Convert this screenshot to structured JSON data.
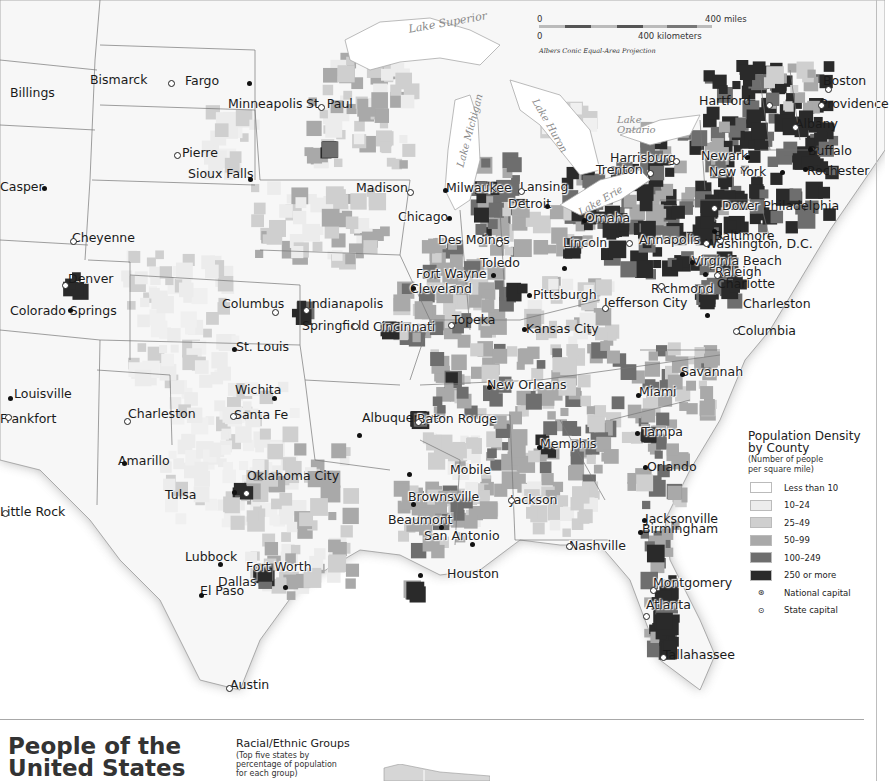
{
  "map": {
    "projection": "Albers Conic Equal-Area Projection",
    "scale": {
      "miles_zero": "0",
      "miles_label": "400 miles",
      "km_zero": "0",
      "km_label": "400 kilometers"
    },
    "lakes": [
      "Lake Superior",
      "Lake Michigan",
      "Lake Huron",
      "Lake Ontario",
      "Lake Erie"
    ],
    "cities": [
      {
        "name": "Billings",
        "type": "city"
      },
      {
        "name": "Bismarck",
        "type": "state-capital"
      },
      {
        "name": "Fargo",
        "type": "city"
      },
      {
        "name": "Pierre",
        "type": "state-capital"
      },
      {
        "name": "Sioux Falls",
        "type": "city"
      },
      {
        "name": "Casper",
        "type": "city"
      },
      {
        "name": "Cheyenne",
        "type": "state-capital"
      },
      {
        "name": "Denver",
        "type": "state-capital"
      },
      {
        "name": "Colorado Springs",
        "type": "city"
      },
      {
        "name": "Minneapolis",
        "type": "city"
      },
      {
        "name": "St. Paul",
        "type": "state-capital"
      },
      {
        "name": "Madison",
        "type": "state-capital"
      },
      {
        "name": "Milwaukee",
        "type": "city"
      },
      {
        "name": "Lansing",
        "type": "state-capital"
      },
      {
        "name": "Detroit",
        "type": "city"
      },
      {
        "name": "Chicago",
        "type": "city"
      },
      {
        "name": "Des Moines",
        "type": "state-capital"
      },
      {
        "name": "Omaha",
        "type": "city"
      },
      {
        "name": "Lincoln",
        "type": "state-capital"
      },
      {
        "name": "Toledo",
        "type": "city"
      },
      {
        "name": "Fort Wayne",
        "type": "city"
      },
      {
        "name": "Cleveland",
        "type": "city"
      },
      {
        "name": "Pittsburgh",
        "type": "city"
      },
      {
        "name": "Columbus",
        "type": "state-capital"
      },
      {
        "name": "Indianapolis",
        "type": "state-capital"
      },
      {
        "name": "Springfield",
        "type": "state-capital"
      },
      {
        "name": "Cincinnati",
        "type": "city"
      },
      {
        "name": "Topeka",
        "type": "state-capital"
      },
      {
        "name": "Kansas City",
        "type": "city"
      },
      {
        "name": "Jefferson City",
        "type": "state-capital"
      },
      {
        "name": "St. Louis",
        "type": "city"
      },
      {
        "name": "Louisville",
        "type": "city"
      },
      {
        "name": "Frankfort",
        "type": "state-capital"
      },
      {
        "name": "Charleston",
        "type": "state-capital"
      },
      {
        "name": "Wichita",
        "type": "city"
      },
      {
        "name": "Santa Fe",
        "type": "state-capital"
      },
      {
        "name": "Albuquerque",
        "type": "city"
      },
      {
        "name": "Amarillo",
        "type": "city"
      },
      {
        "name": "Tulsa",
        "type": "city"
      },
      {
        "name": "Oklahoma City",
        "type": "state-capital"
      },
      {
        "name": "Little Rock",
        "type": "state-capital"
      },
      {
        "name": "Lubbock",
        "type": "city"
      },
      {
        "name": "Fort Worth",
        "type": "city"
      },
      {
        "name": "Dallas",
        "type": "city"
      },
      {
        "name": "El Paso",
        "type": "city"
      },
      {
        "name": "Austin",
        "type": "state-capital"
      },
      {
        "name": "Beaumont",
        "type": "city"
      },
      {
        "name": "Houston",
        "type": "city"
      },
      {
        "name": "San Antonio",
        "type": "city"
      },
      {
        "name": "Brownsville",
        "type": "city"
      },
      {
        "name": "Baton Rouge",
        "type": "state-capital"
      },
      {
        "name": "New Orleans",
        "type": "city"
      },
      {
        "name": "Mobile",
        "type": "city"
      },
      {
        "name": "Jackson",
        "type": "state-capital"
      },
      {
        "name": "Memphis",
        "type": "city"
      },
      {
        "name": "Nashville",
        "type": "state-capital"
      },
      {
        "name": "Birmingham",
        "type": "city"
      },
      {
        "name": "Montgomery",
        "type": "state-capital"
      },
      {
        "name": "Atlanta",
        "type": "state-capital"
      },
      {
        "name": "Tallahassee",
        "type": "state-capital"
      },
      {
        "name": "Jacksonville",
        "type": "city"
      },
      {
        "name": "Orlando",
        "type": "city"
      },
      {
        "name": "Tampa",
        "type": "city"
      },
      {
        "name": "Miami",
        "type": "city"
      },
      {
        "name": "Savannah",
        "type": "city"
      },
      {
        "name": "Charleston",
        "type": "city"
      },
      {
        "name": "Columbia",
        "type": "state-capital"
      },
      {
        "name": "Charlotte",
        "type": "city"
      },
      {
        "name": "Raleigh",
        "type": "state-capital"
      },
      {
        "name": "Richmond",
        "type": "state-capital"
      },
      {
        "name": "Virginia Beach",
        "type": "city"
      },
      {
        "name": "Washington, D.C.",
        "type": "national-capital"
      },
      {
        "name": "Annapolis",
        "type": "state-capital"
      },
      {
        "name": "Baltimore",
        "type": "city"
      },
      {
        "name": "Dover",
        "type": "state-capital"
      },
      {
        "name": "Philadelphia",
        "type": "city"
      },
      {
        "name": "Harrisburg",
        "type": "state-capital"
      },
      {
        "name": "Trenton",
        "type": "state-capital"
      },
      {
        "name": "Newark",
        "type": "city"
      },
      {
        "name": "New York",
        "type": "city"
      },
      {
        "name": "Rochester",
        "type": "city"
      },
      {
        "name": "Buffalo",
        "type": "city"
      },
      {
        "name": "Albany",
        "type": "state-capital"
      },
      {
        "name": "Hartford",
        "type": "state-capital"
      },
      {
        "name": "Providence",
        "type": "state-capital"
      },
      {
        "name": "Boston",
        "type": "state-capital"
      },
      {
        "name": "Concord",
        "type": "state-capital"
      },
      {
        "name": "Montpelier",
        "type": "state-capital"
      },
      {
        "name": "Portland",
        "type": "city"
      },
      {
        "name": "Augusta",
        "type": "state-capital"
      }
    ]
  },
  "legend": {
    "title_line1": "Population Density",
    "title_line2": "by County",
    "subtitle_line1": "(Number of people",
    "subtitle_line2": "per square mile)",
    "classes": [
      {
        "label": "Less than 10",
        "color": "#ffffff"
      },
      {
        "label": "10–24",
        "color": "#ececec"
      },
      {
        "label": "25–49",
        "color": "#cfcfcf"
      },
      {
        "label": "50–99",
        "color": "#a9a9a9"
      },
      {
        "label": "100–249",
        "color": "#6e6e6e"
      },
      {
        "label": "250 or more",
        "color": "#2a2a2a"
      }
    ],
    "symbols": [
      {
        "label": "National capital",
        "glyph": "⊛"
      },
      {
        "label": "State capital",
        "glyph": "⊙"
      }
    ]
  },
  "bottom": {
    "section_title_line1": "People of the",
    "section_title_line2": "United States",
    "racial_title": "Racial/Ethnic Groups",
    "racial_sub_line1": "(Top five states by",
    "racial_sub_line2": "percentage of population",
    "racial_sub_line3": "for each group)"
  }
}
